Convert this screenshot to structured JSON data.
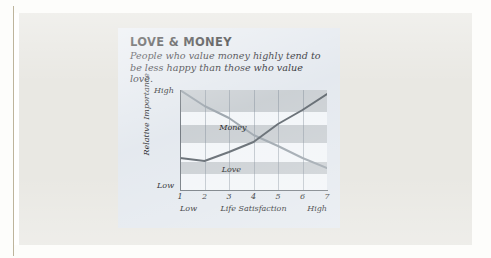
{
  "card": {
    "title": "LOVE & MONEY",
    "subtitle": "People who value money highly tend to be less happy than those who value love."
  },
  "colors": {
    "page_background": "#e9e8e3",
    "card_background": "#e3e8ee",
    "plot_background": "#f2f5f8",
    "band": "#c9ced2",
    "money_line": "#9aa3ab",
    "love_line": "#5d656c",
    "axis": "#6e757c",
    "text": "#17181a"
  },
  "chart_data": {
    "type": "line",
    "title": "LOVE & MONEY",
    "subtitle": "People who value money highly tend to be less happy than those who value love.",
    "xlabel": "Life Satisfaction",
    "ylabel": "Relative Importance",
    "x": [
      1,
      2,
      3,
      4,
      5,
      6,
      7
    ],
    "xticklabels": [
      "1",
      "2",
      "3",
      "4",
      "5",
      "6",
      "7"
    ],
    "x_axis_end_captions": {
      "low": "Low",
      "high": "High"
    },
    "yticklabels": [
      "Low",
      "High"
    ],
    "ylim": [
      0,
      100
    ],
    "ylim_labels": [
      "Low",
      "High"
    ],
    "xlim": [
      1,
      7
    ],
    "grid": "vertical gridlines at each x tick; horizontal shaded bands",
    "legend": "inline series labels",
    "series": [
      {
        "name": "Money",
        "color": "#9aa3ab",
        "values": [
          100,
          84,
          72,
          55,
          44,
          32,
          22
        ]
      },
      {
        "name": "Love",
        "color": "#5d656c",
        "values": [
          32,
          29,
          38,
          48,
          66,
          80,
          96
        ]
      }
    ],
    "annotations": [
      {
        "text": "Money",
        "x": 2.6,
        "y": 62
      },
      {
        "text": "Love",
        "x": 2.7,
        "y": 20
      }
    ],
    "bands": [
      {
        "from": 78,
        "to": 100
      },
      {
        "from": 47,
        "to": 65
      },
      {
        "from": 16,
        "to": 28
      }
    ]
  }
}
